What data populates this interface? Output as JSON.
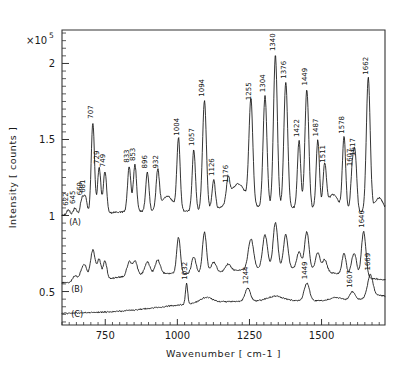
{
  "chart_data": {
    "type": "line",
    "title": "",
    "xlabel": "Wavenumber [ cm-1 ]",
    "ylabel": "Intensity [ counts ]",
    "y_multiplier": "×10",
    "y_multiplier_exp": "5",
    "xlim": [
      600,
      1720
    ],
    "ylim": [
      0.28,
      2.22
    ],
    "xticks": [
      750,
      1000,
      1250,
      1500
    ],
    "xtick_labels": [
      "750",
      "1000",
      "1250",
      "1500"
    ],
    "yticks": [
      0.5,
      1,
      1.5,
      2
    ],
    "ytick_labels": [
      "0.5",
      "1",
      "1.5",
      "2"
    ],
    "grid": false,
    "legend": "none",
    "series": [
      {
        "name": "(A)",
        "label": "(A)",
        "label_x": 625,
        "label_y": 0.935,
        "baseline": 1.0,
        "peaks": [
          {
            "x": 622,
            "label": "622",
            "h": 0.035
          },
          {
            "x": 645,
            "label": "645",
            "h": 0.045
          },
          {
            "x": 669,
            "label": "669",
            "h": 0.1
          },
          {
            "x": 681,
            "label": "681",
            "h": 0.115
          },
          {
            "x": 729,
            "label": "729",
            "h": 0.3
          },
          {
            "x": 749,
            "label": "749",
            "h": 0.275
          },
          {
            "x": 707,
            "label": "707",
            "h": 0.6
          },
          {
            "x": 833,
            "label": "833",
            "h": 0.295
          },
          {
            "x": 853,
            "label": "853",
            "h": 0.305
          },
          {
            "x": 896,
            "label": "896",
            "h": 0.255
          },
          {
            "x": 932,
            "label": "932",
            "h": 0.255
          },
          {
            "x": 1004,
            "label": "1004",
            "h": 0.47
          },
          {
            "x": 1057,
            "label": "1057",
            "h": 0.4
          },
          {
            "x": 1094,
            "label": "1094",
            "h": 0.72
          },
          {
            "x": 1126,
            "label": "1126",
            "h": 0.195
          },
          {
            "x": 1176,
            "label": "1176",
            "h": 0.145
          },
          {
            "x": 1255,
            "label": "1255",
            "h": 0.68
          },
          {
            "x": 1304,
            "label": "1304",
            "h": 0.73
          },
          {
            "x": 1340,
            "label": "1340",
            "h": 1.0
          },
          {
            "x": 1376,
            "label": "1376",
            "h": 0.82
          },
          {
            "x": 1422,
            "label": "1422",
            "h": 0.44
          },
          {
            "x": 1449,
            "label": "1449",
            "h": 0.78
          },
          {
            "x": 1487,
            "label": "1487",
            "h": 0.45
          },
          {
            "x": 1511,
            "label": "1511",
            "h": 0.28
          },
          {
            "x": 1578,
            "label": "1578",
            "h": 0.48
          },
          {
            "x": 1607,
            "label": "1607",
            "h": 0.27
          },
          {
            "x": 1617,
            "label": "1617",
            "h": 0.34
          },
          {
            "x": 1662,
            "label": "1662",
            "h": 0.88
          }
        ]
      },
      {
        "name": "(B)",
        "label": "(B)",
        "label_x": 632,
        "label_y": 0.5,
        "baseline": 0.555,
        "peaks": [
          {
            "x": 1646,
            "label": "1646",
            "h": 0.3
          }
        ]
      },
      {
        "name": "(C)",
        "label": "(C)",
        "label_x": 632,
        "label_y": 0.335,
        "baseline": 0.355,
        "peaks": [
          {
            "x": 1032,
            "label": "1032",
            "h": 0.135
          },
          {
            "x": 1244,
            "label": "1244",
            "h": 0.085
          },
          {
            "x": 1449,
            "label": "1449",
            "h": 0.115
          },
          {
            "x": 1607,
            "label": "1607",
            "h": 0.055
          },
          {
            "x": 1669,
            "label": "1669",
            "h": 0.145
          }
        ]
      }
    ]
  }
}
